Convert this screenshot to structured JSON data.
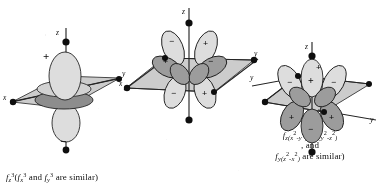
{
  "figure": {
    "kind": "f-orbital-shapes-diagram",
    "panel_count": 3,
    "ink_color": "#161616",
    "plane_fill": "#b9b9b4",
    "page_color": "#fbfbf9"
  },
  "panels": [
    {
      "id": "left",
      "orbital": "fz3",
      "caption": {
        "main_symbol": "f",
        "main_sub": "z",
        "main_sup": "3",
        "paren_open": "(",
        "alt1_symbol": "f",
        "alt1_sub": "x",
        "alt1_sup": "3",
        "conj": "and",
        "alt2_symbol": "f",
        "alt2_sub": "y",
        "alt2_sup": "3",
        "tail": "are similar",
        "paren_close": ")"
      },
      "axes": [
        {
          "name": "z",
          "label": "z",
          "position": "top"
        },
        {
          "name": "x",
          "label": "x",
          "position": "left"
        },
        {
          "name": "y",
          "label": "y",
          "position": "right"
        }
      ],
      "signs": [
        {
          "symbol": "+",
          "where": "upper-lobe"
        },
        {
          "symbol": "−",
          "where": "lower-lobe"
        }
      ],
      "lobe_count": 2,
      "has_torus": true
    },
    {
      "id": "middle",
      "orbital": "fz(x2-y2)",
      "caption": {
        "main_symbol": "f",
        "main_sub_pre": "z(x",
        "main_sup1": "2",
        "main_sub_mid": "-y",
        "main_sup2": "2",
        "main_sub_post": ")",
        "paren_open": "(",
        "alt1_symbol": "f",
        "alt1_sub_pre": "x(y",
        "alt1_sup1": "2",
        "alt1_sub_mid": "-z",
        "alt1_sup2": "2",
        "alt1_sub_post": ")",
        "line2": ", and",
        "alt2_symbol": "f",
        "alt2_sub_pre": "y(z",
        "alt2_sup1": "2",
        "alt2_sub_mid": "-x",
        "alt2_sup2": "2",
        "alt2_sub_post": ")",
        "tail": "are similar)"
      },
      "axes": [
        {
          "name": "z",
          "label": "z",
          "position": "top"
        },
        {
          "name": "x",
          "label": "x",
          "position": "left"
        },
        {
          "name": "y",
          "label": "y",
          "position": "right"
        }
      ],
      "signs": [
        {
          "symbol": "−",
          "where": "upper-left-lobe"
        },
        {
          "symbol": "+",
          "where": "upper-right-lobe"
        },
        {
          "symbol": "+",
          "where": "mid-left-lobe"
        },
        {
          "symbol": "−",
          "where": "mid-right-lobe"
        },
        {
          "symbol": "−",
          "where": "lower-left-lobe"
        },
        {
          "symbol": "+",
          "where": "lower-right-lobe"
        }
      ],
      "lobe_count": 8,
      "has_torus": false
    },
    {
      "id": "right",
      "orbital": "fxyz",
      "caption": {
        "main_symbol": "f",
        "main_sub": "xyz"
      },
      "axes": [
        {
          "name": "z",
          "label": "z",
          "position": "top"
        },
        {
          "name": "y",
          "label": "y",
          "position": "upper-left"
        },
        {
          "name": "y",
          "label": "y",
          "position": "lower-right"
        }
      ],
      "signs": [
        {
          "symbol": "+",
          "where": "top-axis"
        },
        {
          "symbol": "−",
          "where": "upper-left-lobe"
        },
        {
          "symbol": "+",
          "where": "upper-center-lobe"
        },
        {
          "symbol": "−",
          "where": "upper-right-lobe"
        },
        {
          "symbol": "+",
          "where": "lower-left-lobe"
        },
        {
          "symbol": "+",
          "where": "lower-right-lobe"
        },
        {
          "symbol": "−",
          "where": "bottom-lobe"
        }
      ],
      "lobe_count": 8,
      "has_torus": false
    }
  ]
}
